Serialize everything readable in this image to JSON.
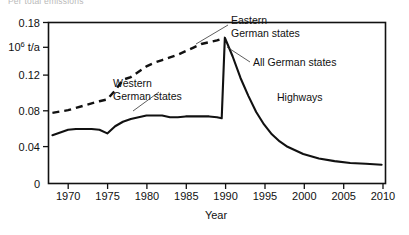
{
  "figure": {
    "clipped_top_text": "Per total emissions",
    "unit_label_mantissa": "10",
    "unit_label_exponent": "6",
    "unit_label_suffix": " t/a"
  },
  "chart_data": {
    "type": "line",
    "title": "",
    "xlabel": "Year",
    "ylabel": "10^6 t/a",
    "xlim": [
      1967.5,
      2010.5
    ],
    "ylim": [
      0,
      0.18
    ],
    "grid": false,
    "legend_position": "inline-annotations",
    "xticks": [
      1970,
      1975,
      1980,
      1985,
      1990,
      1995,
      2000,
      2005,
      2010
    ],
    "xtick_labels": [
      "1970",
      "1975",
      "1980",
      "1985",
      "1990",
      "1995",
      "2000",
      "2005",
      "2010"
    ],
    "yticks": [
      0,
      0.04,
      0.08,
      0.12,
      0.16,
      0.18
    ],
    "ytick_labels": [
      "0",
      "0.04",
      "0.08",
      "0.12",
      "10^6 t/a",
      "0.18"
    ],
    "annotations": [
      {
        "name": "eastern-german-states",
        "line1": "Eastern",
        "line2": "German states"
      },
      {
        "name": "all-german-states",
        "line1": "All German states",
        "line2": ""
      },
      {
        "name": "western-german-states",
        "line1": "Western",
        "line2": "German states"
      },
      {
        "name": "highways",
        "line1": "Highways",
        "line2": ""
      }
    ],
    "series": [
      {
        "name": "Eastern German states",
        "style": "dashed",
        "x": [
          1968,
          1970,
          1972,
          1974,
          1975,
          1976,
          1977,
          1978,
          1979,
          1980,
          1981,
          1982,
          1983,
          1984,
          1985,
          1986,
          1987,
          1988,
          1989,
          1990
        ],
        "values": [
          0.079,
          0.082,
          0.087,
          0.092,
          0.094,
          0.104,
          0.116,
          0.119,
          0.125,
          0.131,
          0.135,
          0.138,
          0.141,
          0.144,
          0.148,
          0.152,
          0.156,
          0.158,
          0.16,
          0.163
        ]
      },
      {
        "name": "Western German states / All German states",
        "style": "solid",
        "x": [
          1968,
          1970,
          1971,
          1973,
          1974,
          1975,
          1976,
          1977,
          1978,
          1980,
          1982,
          1983,
          1984,
          1985,
          1986,
          1987,
          1988,
          1989,
          1989.6,
          1990,
          1991,
          1992,
          1993,
          1994,
          1995,
          1996,
          1997,
          1998,
          2000,
          2002,
          2004,
          2006,
          2008,
          2010
        ],
        "values": [
          0.054,
          0.06,
          0.061,
          0.061,
          0.06,
          0.056,
          0.064,
          0.069,
          0.072,
          0.076,
          0.076,
          0.074,
          0.074,
          0.075,
          0.075,
          0.075,
          0.075,
          0.074,
          0.073,
          0.163,
          0.142,
          0.118,
          0.098,
          0.08,
          0.066,
          0.055,
          0.047,
          0.041,
          0.033,
          0.028,
          0.025,
          0.023,
          0.022,
          0.021
        ]
      }
    ]
  }
}
